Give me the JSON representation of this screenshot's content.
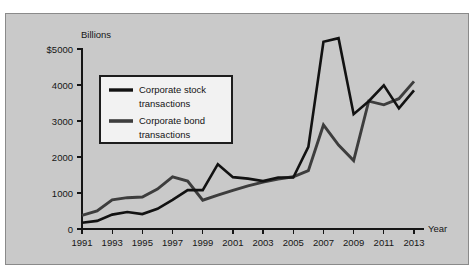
{
  "chart_data": {
    "type": "line",
    "title": "",
    "subtitle": "",
    "xlabel": "Year",
    "ylabel": "Billions",
    "y_unit_prefix": "$",
    "grid": false,
    "legend_position": "upper-left-inside",
    "xlim": [
      1991,
      2013
    ],
    "ylim": [
      0,
      5000
    ],
    "x": [
      1991,
      1992,
      1993,
      1994,
      1995,
      1996,
      1997,
      1998,
      1999,
      2000,
      2001,
      2002,
      2003,
      2004,
      2005,
      2006,
      2007,
      2008,
      2009,
      2010,
      2011,
      2012,
      2013
    ],
    "categories": [
      "1991",
      "1992",
      "1993",
      "1994",
      "1995",
      "1996",
      "1997",
      "1998",
      "1999",
      "2000",
      "2001",
      "2002",
      "2003",
      "2004",
      "2005",
      "2006",
      "2007",
      "2008",
      "2009",
      "2010",
      "2011",
      "2012",
      "2013"
    ],
    "x_tick_labels": [
      "1991",
      "1993",
      "1995",
      "1997",
      "1999",
      "2001",
      "2003",
      "2005",
      "2007",
      "2009",
      "2011",
      "2013"
    ],
    "y_tick_labels": [
      "0",
      "1000",
      "2000",
      "3000",
      "4000",
      "$5000"
    ],
    "y_ticks": [
      0,
      1000,
      2000,
      3000,
      4000,
      5000
    ],
    "series": [
      {
        "name": "Corporate stock transactions",
        "color": "#121212",
        "values": [
          175,
          225,
          400,
          470,
          415,
          560,
          810,
          1080,
          1080,
          1800,
          1440,
          1400,
          1330,
          1430,
          1430,
          2280,
          5200,
          5300,
          3190,
          3550,
          3990,
          3350,
          3850
        ]
      },
      {
        "name": "Corporate bond transactions",
        "color": "#3d3d3d",
        "values": [
          380,
          500,
          810,
          870,
          890,
          1110,
          1450,
          1330,
          800,
          940,
          1070,
          1200,
          1300,
          1390,
          1450,
          1620,
          2890,
          2330,
          1900,
          3550,
          3450,
          3620,
          4100
        ]
      }
    ],
    "legend": [
      {
        "label_line1": "Corporate stock",
        "label_line2": "transactions",
        "color": "#121212"
      },
      {
        "label_line1": "Corporate bond",
        "label_line2": "transactions",
        "color": "#3d3d3d"
      }
    ],
    "annotations": []
  },
  "figure": {
    "background_color": "#c9c9c9",
    "border_color": "#8a8a8a",
    "page_background": "#ffffff"
  }
}
